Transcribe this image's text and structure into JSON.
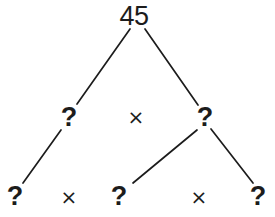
{
  "diagram": {
    "background_color": "#ffffff",
    "stroke_color": "#1c1c1c",
    "stroke_width": 1.6,
    "nodes": [
      {
        "id": "root",
        "label": "45",
        "x": 134,
        "y": 16,
        "kind": "number"
      },
      {
        "id": "l1",
        "label": "?",
        "x": 69,
        "y": 117,
        "kind": "unknown"
      },
      {
        "id": "r1",
        "label": "?",
        "x": 205,
        "y": 117,
        "kind": "unknown"
      },
      {
        "id": "b1",
        "label": "?",
        "x": 15,
        "y": 196,
        "kind": "unknown"
      },
      {
        "id": "b2",
        "label": "?",
        "x": 119,
        "y": 196,
        "kind": "unknown"
      },
      {
        "id": "b3",
        "label": "?",
        "x": 258,
        "y": 196,
        "kind": "unknown"
      }
    ],
    "operators": [
      {
        "id": "op-mid",
        "label": "×",
        "x": 136,
        "y": 117
      },
      {
        "id": "op-bottom-1",
        "label": "×",
        "x": 69,
        "y": 197
      },
      {
        "id": "op-bottom-2",
        "label": "×",
        "x": 199,
        "y": 197
      }
    ],
    "edges": [
      {
        "id": "root-to-l1",
        "from": "root",
        "to": "l1",
        "x1": 130,
        "y1": 29,
        "x2": 77,
        "y2": 104
      },
      {
        "id": "root-to-r1",
        "from": "root",
        "to": "r1",
        "x1": 145,
        "y1": 29,
        "x2": 198,
        "y2": 105
      },
      {
        "id": "l1-to-b1",
        "from": "l1",
        "to": "b1",
        "x1": 61,
        "y1": 130,
        "x2": 23,
        "y2": 183
      },
      {
        "id": "r1-to-b2",
        "from": "r1",
        "to": "b2",
        "x1": 197,
        "y1": 130,
        "x2": 133,
        "y2": 183
      },
      {
        "id": "r1-to-b3",
        "from": "r1",
        "to": "b3",
        "x1": 211,
        "y1": 129,
        "x2": 253,
        "y2": 183
      }
    ]
  }
}
